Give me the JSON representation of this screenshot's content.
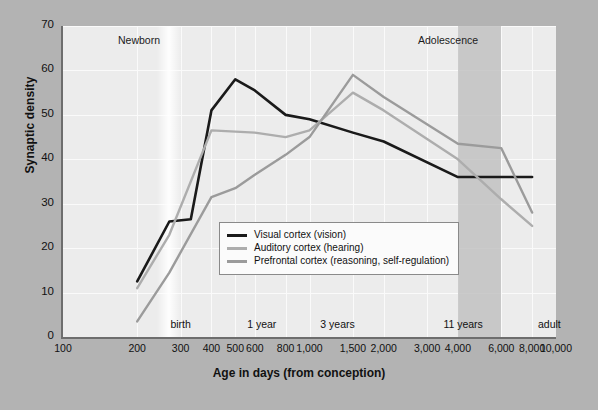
{
  "chart_data": {
    "type": "line",
    "title": "",
    "xlabel": "Age in days (from conception)",
    "ylabel": "Synaptic density",
    "xscale": "log",
    "xlim": [
      100,
      10000
    ],
    "ylim": [
      0,
      70
    ],
    "grid": true,
    "legend_position": "center",
    "x_tick_labels": [
      "100",
      "200",
      "300",
      "400",
      "500",
      "600",
      "800",
      "1,000",
      "1,500",
      "2,000",
      "3,000",
      "4,000",
      "6,000",
      "8,000",
      "10,000"
    ],
    "x_tick_values": [
      100,
      200,
      300,
      400,
      500,
      600,
      800,
      1000,
      1500,
      2000,
      3000,
      4000,
      6000,
      8000,
      10000
    ],
    "y_tick_labels": [
      "0",
      "10",
      "20",
      "30",
      "40",
      "50",
      "60",
      "70"
    ],
    "y_tick_values": [
      0,
      10,
      20,
      30,
      40,
      50,
      60,
      70
    ],
    "stage_labels": [
      {
        "text": "birth",
        "x": 300
      },
      {
        "text": "1 year",
        "x": 640
      },
      {
        "text": "3 years",
        "x": 1300
      },
      {
        "text": "11 years",
        "x": 4200
      },
      {
        "text": "adult",
        "x": 9400
      }
    ],
    "period_bands": [
      {
        "label": "Newborn",
        "x_start": 255,
        "x_end": 285,
        "style": "light"
      },
      {
        "label": "Adolescence",
        "x_start": 4000,
        "x_end": 6000,
        "style": "shaded"
      }
    ],
    "series": [
      {
        "name": "Visual cortex (vision)",
        "color": "#1a1a1a",
        "x": [
          200,
          270,
          330,
          400,
          500,
          600,
          800,
          1000,
          1500,
          2000,
          4000,
          6000,
          8000
        ],
        "values": [
          12.5,
          26,
          26.5,
          51,
          58,
          55.5,
          50,
          49,
          46,
          44,
          36,
          36,
          36
        ]
      },
      {
        "name": "Auditory cortex (hearing)",
        "color": "#adadad",
        "x": [
          200,
          270,
          400,
          600,
          800,
          1000,
          1500,
          2000,
          4000,
          6000,
          8000
        ],
        "values": [
          11,
          23,
          46.5,
          46,
          45,
          46.5,
          55,
          51,
          40,
          31,
          25
        ]
      },
      {
        "name": "Prefrontal cortex (reasoning, self-regulation)",
        "color": "#9b9b9b",
        "x": [
          200,
          270,
          400,
          500,
          600,
          800,
          1000,
          1500,
          2000,
          4000,
          6000,
          8000
        ],
        "values": [
          3.5,
          14.5,
          31.5,
          33.5,
          36.5,
          41,
          45,
          59,
          54,
          43.5,
          42.5,
          28
        ]
      }
    ],
    "legend_entries": [
      {
        "label": "Visual cortex (vision)",
        "color": "#1a1a1a"
      },
      {
        "label": "Auditory cortex (hearing)",
        "color": "#adadad"
      },
      {
        "label": "Prefrontal cortex (reasoning, self-regulation)",
        "color": "#9b9b9b"
      }
    ]
  }
}
